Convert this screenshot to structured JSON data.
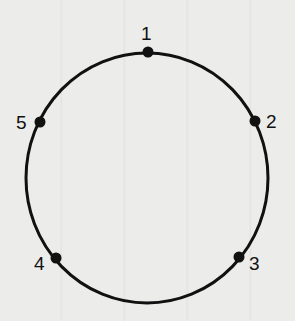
{
  "diagram": {
    "shape": "circle",
    "center": {
      "x": 147,
      "y": 178
    },
    "radius_x": 121,
    "radius_y": 125,
    "stroke_color": "#111111",
    "points": [
      {
        "label": "1",
        "x": 148,
        "y": 52,
        "label_x": 141,
        "label_y": 40
      },
      {
        "label": "2",
        "x": 255,
        "y": 121,
        "label_x": 266,
        "label_y": 128
      },
      {
        "label": "3",
        "x": 239,
        "y": 257,
        "label_x": 249,
        "label_y": 270
      },
      {
        "label": "4",
        "x": 56,
        "y": 258,
        "label_x": 34,
        "label_y": 270
      },
      {
        "label": "5",
        "x": 40,
        "y": 122,
        "label_x": 16,
        "label_y": 129
      }
    ]
  }
}
